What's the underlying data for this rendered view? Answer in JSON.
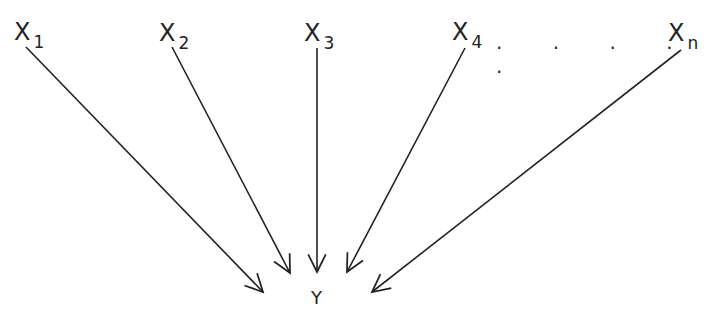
{
  "diagram": {
    "type": "many-to-one arrow diagram",
    "inputs": [
      {
        "var": "X",
        "sub": "1"
      },
      {
        "var": "X",
        "sub": "2"
      },
      {
        "var": "X",
        "sub": "3"
      },
      {
        "var": "X",
        "sub": "4"
      },
      {
        "var": "X",
        "sub": "n"
      }
    ],
    "ellipsis": ". . . . .",
    "output": "Y",
    "stroke_color": "#222222"
  }
}
